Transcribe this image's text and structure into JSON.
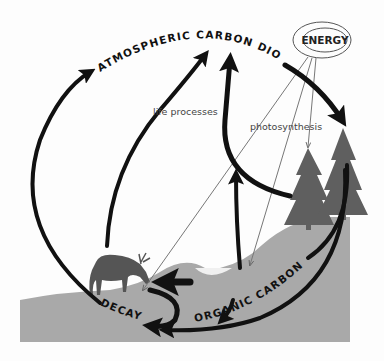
{
  "diagram": {
    "labels": {
      "atmosphere": "ATMOSPHERIC CARBON DIOXIDE",
      "energy": "ENERGY",
      "life_processes": "life processes",
      "photosynthesis": "photosynthesis",
      "organic_carbon": "ORGANIC CARBON",
      "decay": "DECAY"
    },
    "nodes": [
      {
        "id": "atmosphere",
        "label": "ATMOSPHERIC CARBON DIOXIDE"
      },
      {
        "id": "energy",
        "label": "ENERGY"
      },
      {
        "id": "organic_carbon",
        "label": "ORGANIC CARBON"
      },
      {
        "id": "decay",
        "label": "DECAY"
      },
      {
        "id": "trees",
        "label": ""
      },
      {
        "id": "deer",
        "label": ""
      }
    ],
    "edges": [
      {
        "from": "atmosphere",
        "to": "trees",
        "label": ""
      },
      {
        "from": "energy",
        "to": "trees",
        "label": "photosynthesis"
      },
      {
        "from": "trees",
        "to": "atmosphere",
        "label": "life processes"
      },
      {
        "from": "deer",
        "to": "atmosphere",
        "label": "life processes"
      },
      {
        "from": "organic_carbon",
        "to": "atmosphere",
        "label": ""
      },
      {
        "from": "decay",
        "to": "atmosphere",
        "label": ""
      },
      {
        "from": "trees",
        "to": "organic_carbon",
        "label": ""
      },
      {
        "from": "organic_carbon",
        "to": "decay",
        "label": ""
      },
      {
        "from": "trees",
        "to": "decay",
        "label": ""
      }
    ],
    "colors": {
      "ground": "#a9a9a9",
      "trees": "#5f5f5f",
      "deer": "#555555",
      "arrows": "#111111",
      "thin_lines": "#777777",
      "background": "#fdfdfd"
    }
  }
}
